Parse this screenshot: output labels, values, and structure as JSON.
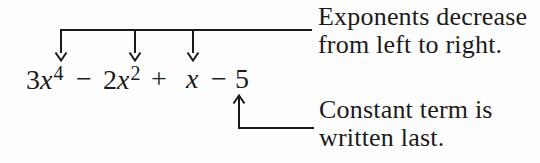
{
  "colors": {
    "ink": "#1b1b1b",
    "paper": "#fdfdfd"
  },
  "expression": {
    "t1_coef": "3",
    "t1_var": "x",
    "t1_exp": "4",
    "op1": "−",
    "t2_coef": "2",
    "t2_var": "x",
    "t2_exp": "2",
    "op2": "+",
    "t3_var": "x",
    "op3": "−",
    "t4_const": "5"
  },
  "callouts": {
    "exponents": {
      "line1": "Exponents decrease",
      "line2": "from left to right."
    },
    "constant": {
      "line1": "Constant term is",
      "line2": "written last."
    }
  },
  "icons": {
    "down_arrow": "↓",
    "up_arrow": "↑"
  }
}
